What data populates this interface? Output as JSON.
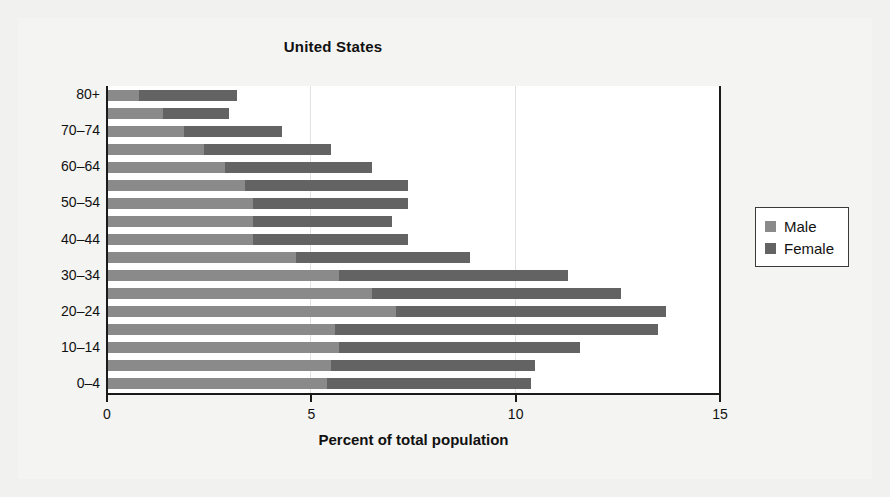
{
  "chart_data": {
    "type": "bar",
    "subtype": "stacked-horizontal-bar",
    "title": "United States",
    "xlabel": "Percent of total population",
    "ylabel": "",
    "xlim": [
      0,
      15
    ],
    "ylim": null,
    "grid": true,
    "gridlines_x": [
      5,
      10
    ],
    "xticks": [
      0,
      5,
      10,
      15
    ],
    "xtick_labels": [
      "0",
      "5",
      "10",
      "15"
    ],
    "legend": {
      "position": "right-outside",
      "entries": [
        {
          "name": "Male",
          "color": "#8a8a8a"
        },
        {
          "name": "Female",
          "color": "#636363"
        }
      ]
    },
    "categories": [
      "80+",
      "75-79",
      "70-74",
      "65-69",
      "60-64",
      "55-59",
      "50-54",
      "45-49",
      "40-44",
      "35-39",
      "30-34",
      "25-29",
      "20-24",
      "15-19",
      "10-14",
      "5-9",
      "0-4"
    ],
    "ytick_labels_shown": [
      "80+",
      "70-74",
      "60-64",
      "50-54",
      "40-44",
      "30-34",
      "20-24",
      "10-14",
      "0-4"
    ],
    "series": [
      {
        "name": "Male",
        "color": "#8a8a8a",
        "values": [
          0.8,
          1.4,
          1.9,
          2.4,
          2.9,
          3.4,
          3.6,
          3.6,
          3.6,
          4.65,
          5.7,
          6.5,
          7.1,
          5.6,
          5.7,
          5.5,
          5.4
        ]
      },
      {
        "name": "Female",
        "color": "#636363",
        "values": [
          2.4,
          1.6,
          2.4,
          3.1,
          3.6,
          4.0,
          3.8,
          3.4,
          3.8,
          4.25,
          5.6,
          6.1,
          6.6,
          7.9,
          5.9,
          5.0,
          5.0
        ]
      }
    ],
    "totals": [
      3.2,
      3.0,
      4.3,
      5.5,
      6.5,
      7.4,
      7.4,
      7.0,
      7.4,
      8.9,
      11.3,
      12.6,
      13.7,
      13.5,
      11.6,
      10.5,
      10.4
    ]
  },
  "colors": {
    "male": "#8a8a8a",
    "female": "#636363",
    "axis": "#1a1a1a",
    "grid": "#e2e2e2",
    "plot_background": "#ffffff",
    "figure_background": "#f4f4f2"
  }
}
